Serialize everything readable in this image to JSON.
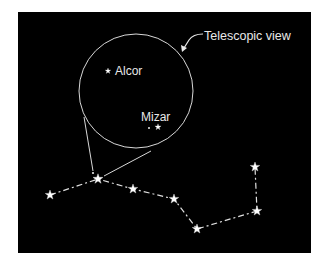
{
  "diagram": {
    "title_callout": "Telescopic view",
    "colors": {
      "background": "#000000",
      "page": "#ffffff",
      "foreground": "#e8e8e8"
    },
    "telescopic_view": {
      "center": [
        136,
        91
      ],
      "radius": 57,
      "stars": [
        {
          "name": "Alcor",
          "label": "Alcor",
          "x": 108,
          "y": 70
        },
        {
          "name": "Mizar",
          "label": "Mizar",
          "x": 158,
          "y": 127
        },
        {
          "name": "Mizar companion",
          "label": "",
          "x": 149,
          "y": 128
        }
      ]
    },
    "constellation": {
      "stars": [
        {
          "x": 50,
          "y": 195
        },
        {
          "x": 98,
          "y": 179
        },
        {
          "x": 133,
          "y": 189
        },
        {
          "x": 174,
          "y": 199
        },
        {
          "x": 197,
          "y": 229
        },
        {
          "x": 257,
          "y": 211
        },
        {
          "x": 255,
          "y": 167
        }
      ],
      "mizar_dot": {
        "x": 93,
        "y": 173
      }
    }
  }
}
